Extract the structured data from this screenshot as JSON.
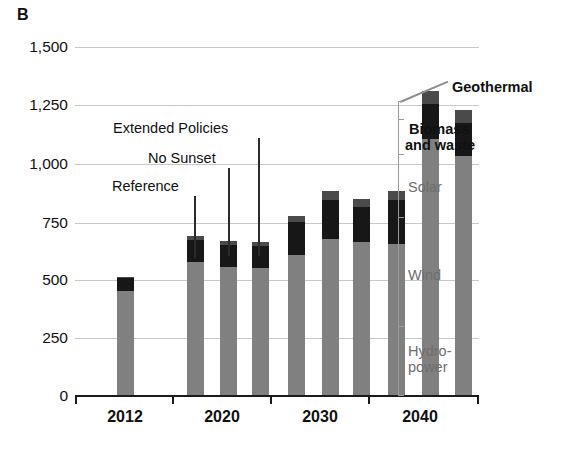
{
  "panel": {
    "letter": "B"
  },
  "chart_data": {
    "type": "bar",
    "subtype": "stacked-grouped-bar",
    "title": "",
    "xlabel": "",
    "ylabel": "",
    "ylim": [
      0,
      1500
    ],
    "ytick_labels": [
      "0",
      "250",
      "500",
      "750",
      "1,000",
      "1,250",
      "1,500"
    ],
    "ytick_values": [
      0,
      250,
      500,
      750,
      1000,
      1250,
      1500
    ],
    "grid": true,
    "grid_axis": "y",
    "legend_position": "right-of-last-bar",
    "categories": [
      "2012",
      "2020",
      "2030",
      "2040"
    ],
    "scenarios": [
      "Reference",
      "No Sunset",
      "Extended Policies"
    ],
    "stack_order": [
      "Hydropower",
      "Wind",
      "Solar",
      "Biomass and waste",
      "Geothermal"
    ],
    "stack_colors": {
      "Hydropower": "#808080",
      "Wind": "#808080",
      "Solar": "#808080",
      "Biomass and waste": "#171717",
      "Geothermal": "#4a4a4a"
    },
    "bars": [
      {
        "group": "2012",
        "scenario": "Reference",
        "total": 500,
        "segments": {
          "Hydropower": 290,
          "Wind": 140,
          "Solar": 10,
          "Biomass and waste": 55,
          "Geothermal": 5
        }
      },
      {
        "group": "2020",
        "scenario": "Reference",
        "total": 670,
        "segments": {
          "Hydropower": 290,
          "Wind": 240,
          "Solar": 30,
          "Biomass and waste": 95,
          "Geothermal": 15
        }
      },
      {
        "group": "2020",
        "scenario": "No Sunset",
        "total": 650,
        "segments": {
          "Hydropower": 290,
          "Wind": 225,
          "Solar": 25,
          "Biomass and waste": 95,
          "Geothermal": 15
        }
      },
      {
        "group": "2020",
        "scenario": "Extended Policies",
        "total": 645,
        "segments": {
          "Hydropower": 290,
          "Wind": 220,
          "Solar": 25,
          "Biomass and waste": 95,
          "Geothermal": 15
        }
      },
      {
        "group": "2030",
        "scenario": "Reference",
        "total": 755,
        "segments": {
          "Hydropower": 295,
          "Wind": 255,
          "Solar": 40,
          "Biomass and waste": 140,
          "Geothermal": 25
        }
      },
      {
        "group": "2030",
        "scenario": "No Sunset",
        "total": 860,
        "segments": {
          "Hydropower": 295,
          "Wind": 310,
          "Solar": 55,
          "Biomass and waste": 165,
          "Geothermal": 35
        }
      },
      {
        "group": "2030",
        "scenario": "Extended Policies",
        "total": 830,
        "segments": {
          "Hydropower": 295,
          "Wind": 295,
          "Solar": 55,
          "Biomass and waste": 150,
          "Geothermal": 35
        }
      },
      {
        "group": "2040",
        "scenario": "Reference",
        "total": 860,
        "segments": {
          "Hydropower": 295,
          "Wind": 280,
          "Solar": 65,
          "Biomass and waste": 185,
          "Geothermal": 35
        }
      },
      {
        "group": "2040",
        "scenario": "No Sunset",
        "total": 1285,
        "segments": {
          "Hydropower": 300,
          "Wind": 600,
          "Solar": 180,
          "Biomass and waste": 150,
          "Geothermal": 55
        }
      },
      {
        "group": "2040",
        "scenario": "Extended Policies",
        "total": 1205,
        "segments": {
          "Hydropower": 300,
          "Wind": 545,
          "Solar": 165,
          "Biomass and waste": 140,
          "Geothermal": 55
        }
      }
    ],
    "annotations": [
      {
        "text": "Extended Policies",
        "points_to": "2020 Extended Policies bar"
      },
      {
        "text": "No Sunset",
        "points_to": "2020 No Sunset bar"
      },
      {
        "text": "Reference",
        "points_to": "2020 Reference bar"
      }
    ],
    "series_legend": [
      {
        "label": "Geothermal",
        "style": "dark"
      },
      {
        "label": "Biomass\nand waste",
        "style": "dark"
      },
      {
        "label": "Solar",
        "style": "gray"
      },
      {
        "label": "Wind",
        "style": "gray"
      },
      {
        "label": "Hydro-\npower",
        "style": "gray"
      }
    ]
  },
  "axes": {
    "y_labels": [
      "1,500",
      "1,250",
      "1,000",
      "750",
      "500",
      "250",
      "0"
    ],
    "x_labels": [
      "2012",
      "2020",
      "2030",
      "2040"
    ]
  },
  "callouts": {
    "extended": "Extended Policies",
    "nosunset": "No Sunset",
    "reference": "Reference"
  },
  "legend": {
    "geothermal": "Geothermal",
    "biomass_line1": "Biomass",
    "biomass_line2": "and waste",
    "solar": "Solar",
    "wind": "Wind",
    "hydro_line1": "Hydro-",
    "hydro_line2": "power"
  }
}
